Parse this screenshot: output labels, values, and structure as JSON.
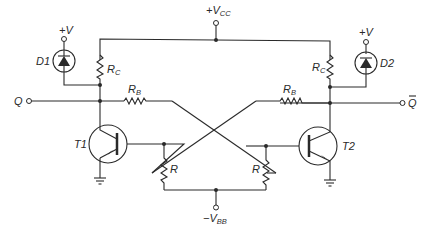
{
  "diagram": {
    "type": "circuit-schematic",
    "supply_top": {
      "label_prefix": "+V",
      "label_sub": "CC"
    },
    "supply_bottom": {
      "label_prefix": "−V",
      "label_sub": "BB"
    },
    "left": {
      "diode": {
        "label": "D1",
        "supply": "+V"
      },
      "collector_resistor": {
        "label_main": "R",
        "label_sub": "C"
      },
      "base_resistor": {
        "label_main": "R",
        "label_sub": "B"
      },
      "transistor": {
        "label": "T1"
      },
      "bias_resistor": {
        "label": "R"
      },
      "output": {
        "label": "Q"
      }
    },
    "right": {
      "diode": {
        "label": "D2",
        "supply": "+V"
      },
      "collector_resistor": {
        "label_main": "R",
        "label_sub": "C"
      },
      "base_resistor": {
        "label_main": "R",
        "label_sub": "B"
      },
      "transistor": {
        "label": "T2"
      },
      "bias_resistor": {
        "label": "R"
      },
      "output": {
        "label": "Q̅",
        "label_plain": "Q"
      }
    }
  }
}
